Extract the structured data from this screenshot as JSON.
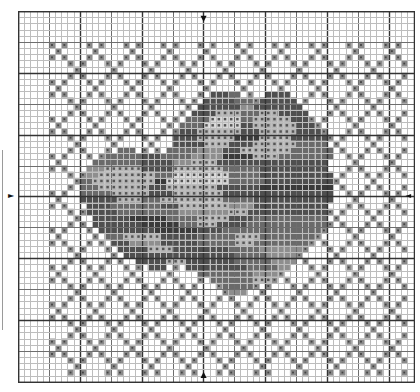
{
  "chart": {
    "cols": 64,
    "rows": 60,
    "cell_px": 6.18,
    "minor_every": 1,
    "mid_every": 5,
    "major_every": 10,
    "center_col": 30,
    "center_row": 30,
    "colors": {
      "background": "#ffffff",
      "minor_line": "#bdbdbd",
      "mid_line": "#6e6e6e",
      "major_line": "#333333",
      "center_line": "#111111",
      "lattice_fill": "#b8b8b8",
      "lattice_dark": "#8a8a8a"
    },
    "shades": {
      "1": "#d6d6d6",
      "2": "#b5b5b5",
      "3": "#8e8e8e",
      "4": "#6a6a6a",
      "5": "#4f4f4f",
      "6": "#3a3a3a"
    },
    "lattice": {
      "period": 6,
      "col_min": 5,
      "col_max": 63,
      "row_min": 5,
      "row_max": 59
    },
    "flower_rows": [
      {
        "r": 13,
        "runs": [
          [
            31,
            3,
            5
          ],
          [
            34,
            2,
            4
          ],
          [
            40,
            4,
            5
          ]
        ]
      },
      {
        "r": 14,
        "runs": [
          [
            30,
            5,
            5
          ],
          [
            35,
            3,
            4
          ],
          [
            39,
            6,
            5
          ]
        ]
      },
      {
        "r": 15,
        "runs": [
          [
            29,
            7,
            5
          ],
          [
            36,
            3,
            3
          ],
          [
            38,
            8,
            5
          ]
        ]
      },
      {
        "r": 16,
        "runs": [
          [
            28,
            4,
            5
          ],
          [
            32,
            4,
            2
          ],
          [
            36,
            3,
            4
          ],
          [
            39,
            3,
            2
          ],
          [
            42,
            5,
            5
          ]
        ]
      },
      {
        "r": 17,
        "runs": [
          [
            27,
            4,
            4
          ],
          [
            31,
            5,
            1
          ],
          [
            36,
            2,
            4
          ],
          [
            38,
            6,
            2
          ],
          [
            44,
            3,
            5
          ]
        ]
      },
      {
        "r": 18,
        "runs": [
          [
            26,
            4,
            4
          ],
          [
            30,
            6,
            1
          ],
          [
            36,
            2,
            5
          ],
          [
            38,
            7,
            2
          ],
          [
            45,
            3,
            5
          ]
        ]
      },
      {
        "r": 19,
        "runs": [
          [
            26,
            3,
            5
          ],
          [
            29,
            7,
            2
          ],
          [
            36,
            3,
            5
          ],
          [
            39,
            6,
            2
          ],
          [
            45,
            4,
            5
          ]
        ]
      },
      {
        "r": 20,
        "runs": [
          [
            25,
            4,
            5
          ],
          [
            29,
            6,
            2
          ],
          [
            35,
            4,
            6
          ],
          [
            39,
            5,
            2
          ],
          [
            44,
            6,
            5
          ]
        ]
      },
      {
        "r": 21,
        "runs": [
          [
            25,
            5,
            5
          ],
          [
            30,
            4,
            2
          ],
          [
            34,
            4,
            5
          ],
          [
            38,
            7,
            2
          ],
          [
            45,
            5,
            4
          ]
        ]
      },
      {
        "r": 22,
        "runs": [
          [
            16,
            3,
            4
          ],
          [
            24,
            5,
            4
          ],
          [
            29,
            4,
            3
          ],
          [
            33,
            3,
            5
          ],
          [
            36,
            8,
            2
          ],
          [
            44,
            7,
            4
          ]
        ]
      },
      {
        "r": 23,
        "runs": [
          [
            14,
            6,
            4
          ],
          [
            20,
            3,
            5
          ],
          [
            23,
            5,
            4
          ],
          [
            28,
            5,
            3
          ],
          [
            33,
            5,
            6
          ],
          [
            38,
            4,
            2
          ],
          [
            42,
            9,
            4
          ]
        ]
      },
      {
        "r": 24,
        "runs": [
          [
            12,
            8,
            4
          ],
          [
            20,
            5,
            5
          ],
          [
            25,
            3,
            3
          ],
          [
            28,
            4,
            2
          ],
          [
            32,
            6,
            5
          ],
          [
            38,
            12,
            5
          ]
        ]
      },
      {
        "r": 25,
        "runs": [
          [
            11,
            3,
            3
          ],
          [
            14,
            6,
            2
          ],
          [
            20,
            5,
            5
          ],
          [
            25,
            8,
            2
          ],
          [
            33,
            6,
            4
          ],
          [
            39,
            11,
            5
          ]
        ]
      },
      {
        "r": 26,
        "runs": [
          [
            11,
            2,
            3
          ],
          [
            13,
            9,
            2
          ],
          [
            22,
            3,
            4
          ],
          [
            25,
            9,
            1
          ],
          [
            34,
            5,
            4
          ],
          [
            39,
            12,
            5
          ]
        ]
      },
      {
        "r": 27,
        "runs": [
          [
            10,
            2,
            4
          ],
          [
            12,
            10,
            2
          ],
          [
            22,
            2,
            6
          ],
          [
            24,
            10,
            1
          ],
          [
            34,
            6,
            4
          ],
          [
            40,
            11,
            5
          ]
        ]
      },
      {
        "r": 28,
        "runs": [
          [
            10,
            3,
            4
          ],
          [
            13,
            8,
            2
          ],
          [
            21,
            3,
            5
          ],
          [
            24,
            8,
            2
          ],
          [
            32,
            7,
            5
          ],
          [
            39,
            12,
            6
          ]
        ]
      },
      {
        "r": 29,
        "runs": [
          [
            10,
            5,
            4
          ],
          [
            15,
            6,
            2
          ],
          [
            21,
            4,
            5
          ],
          [
            25,
            8,
            2
          ],
          [
            33,
            6,
            5
          ],
          [
            39,
            12,
            5
          ]
        ]
      },
      {
        "r": 30,
        "runs": [
          [
            10,
            6,
            5
          ],
          [
            16,
            4,
            2
          ],
          [
            20,
            3,
            4
          ],
          [
            23,
            10,
            2
          ],
          [
            33,
            5,
            4
          ],
          [
            38,
            13,
            5
          ]
        ]
      },
      {
        "r": 31,
        "runs": [
          [
            11,
            4,
            5
          ],
          [
            15,
            8,
            4
          ],
          [
            23,
            3,
            5
          ],
          [
            26,
            8,
            2
          ],
          [
            34,
            4,
            3
          ],
          [
            38,
            12,
            5
          ]
        ]
      },
      {
        "r": 32,
        "runs": [
          [
            11,
            5,
            5
          ],
          [
            16,
            10,
            4
          ],
          [
            26,
            8,
            3
          ],
          [
            34,
            3,
            2
          ],
          [
            37,
            13,
            5
          ]
        ]
      },
      {
        "r": 33,
        "runs": [
          [
            12,
            6,
            5
          ],
          [
            18,
            6,
            6
          ],
          [
            24,
            5,
            4
          ],
          [
            29,
            5,
            2
          ],
          [
            34,
            4,
            5
          ],
          [
            38,
            12,
            4
          ]
        ]
      },
      {
        "r": 34,
        "runs": [
          [
            12,
            8,
            5
          ],
          [
            20,
            6,
            6
          ],
          [
            26,
            3,
            4
          ],
          [
            29,
            3,
            2
          ],
          [
            32,
            5,
            5
          ],
          [
            37,
            13,
            4
          ]
        ]
      },
      {
        "r": 35,
        "runs": [
          [
            13,
            9,
            5
          ],
          [
            22,
            7,
            6
          ],
          [
            29,
            4,
            5
          ],
          [
            33,
            6,
            4
          ],
          [
            39,
            10,
            4
          ]
        ]
      },
      {
        "r": 36,
        "runs": [
          [
            14,
            3,
            4
          ],
          [
            17,
            6,
            2
          ],
          [
            23,
            6,
            5
          ],
          [
            29,
            6,
            4
          ],
          [
            35,
            4,
            2
          ],
          [
            39,
            9,
            4
          ]
        ]
      },
      {
        "r": 37,
        "runs": [
          [
            15,
            3,
            5
          ],
          [
            18,
            5,
            3
          ],
          [
            23,
            6,
            5
          ],
          [
            29,
            6,
            4
          ],
          [
            35,
            3,
            2
          ],
          [
            38,
            9,
            4
          ]
        ]
      },
      {
        "r": 38,
        "runs": [
          [
            16,
            5,
            5
          ],
          [
            21,
            4,
            2
          ],
          [
            25,
            9,
            5
          ],
          [
            34,
            5,
            4
          ],
          [
            39,
            7,
            3
          ]
        ]
      },
      {
        "r": 39,
        "runs": [
          [
            17,
            7,
            5
          ],
          [
            24,
            11,
            5
          ],
          [
            35,
            5,
            4
          ],
          [
            40,
            5,
            3
          ]
        ]
      },
      {
        "r": 40,
        "runs": [
          [
            19,
            5,
            5
          ],
          [
            24,
            3,
            2
          ],
          [
            27,
            8,
            5
          ],
          [
            35,
            6,
            4
          ],
          [
            41,
            4,
            3
          ]
        ]
      },
      {
        "r": 41,
        "runs": [
          [
            21,
            3,
            5
          ],
          [
            27,
            10,
            5
          ],
          [
            37,
            5,
            4
          ],
          [
            42,
            2,
            3
          ]
        ]
      },
      {
        "r": 42,
        "runs": [
          [
            29,
            9,
            4
          ],
          [
            38,
            4,
            3
          ]
        ]
      },
      {
        "r": 43,
        "runs": [
          [
            31,
            7,
            4
          ],
          [
            38,
            3,
            2
          ]
        ]
      },
      {
        "r": 44,
        "runs": [
          [
            33,
            5,
            4
          ]
        ]
      },
      {
        "r": 45,
        "runs": [
          [
            34,
            3,
            3
          ]
        ]
      }
    ],
    "markers": {
      "top": {
        "glyph": "▼",
        "label": "center-top"
      },
      "bottom": {
        "glyph": "▲",
        "label": "center-bottom"
      },
      "left": {
        "glyph": "►",
        "label": "center-left"
      },
      "right": {
        "glyph": "◄",
        "label": "center-right"
      }
    }
  }
}
